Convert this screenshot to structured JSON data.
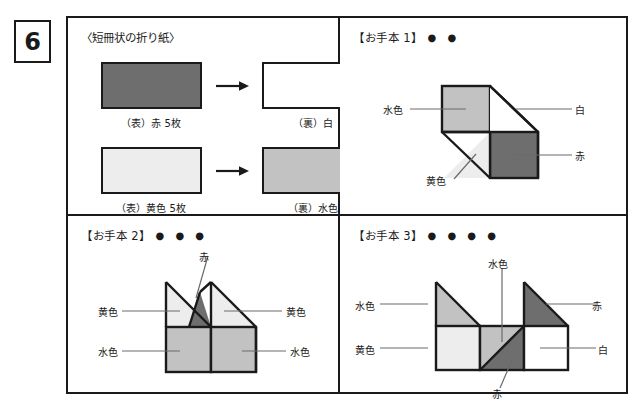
{
  "question": {
    "number": "6"
  },
  "colors": {
    "red": "#6e6e6e",
    "yellow": "#ededed",
    "lightblue": "#c2c2c2",
    "white": "#ffffff",
    "ink": "#1a1a1a"
  },
  "panel_paper": {
    "heading": "〈短冊状の折り紙〉",
    "rows": [
      {
        "front_label": "（表）赤 5枚",
        "front_color": "red",
        "back_label": "（裏）白",
        "back_color": "white"
      },
      {
        "front_label": "（表）黄色 5枚",
        "front_color": "yellow",
        "back_label": "（裏）水色",
        "back_color": "lightblue"
      }
    ]
  },
  "panel_model1": {
    "title": "【お手本 1】",
    "dots": "● ●",
    "labels": [
      {
        "text": "水色",
        "side": "left"
      },
      {
        "text": "白",
        "side": "right"
      },
      {
        "text": "赤",
        "side": "right"
      },
      {
        "text": "黄色",
        "side": "left"
      }
    ]
  },
  "panel_model2": {
    "title": "【お手本 2】",
    "dots": "● ● ●",
    "labels": [
      {
        "text": "赤",
        "side": "top"
      },
      {
        "text": "黄色",
        "side": "left"
      },
      {
        "text": "黄色",
        "side": "right"
      },
      {
        "text": "水色",
        "side": "left"
      },
      {
        "text": "水色",
        "side": "right"
      }
    ]
  },
  "panel_model3": {
    "title": "【お手本 3】",
    "dots": "● ● ● ●",
    "labels": [
      {
        "text": "水色",
        "side": "left"
      },
      {
        "text": "水色",
        "side": "top"
      },
      {
        "text": "赤",
        "side": "right"
      },
      {
        "text": "黄色",
        "side": "left"
      },
      {
        "text": "白",
        "side": "right"
      },
      {
        "text": "赤",
        "side": "bottom"
      }
    ]
  }
}
